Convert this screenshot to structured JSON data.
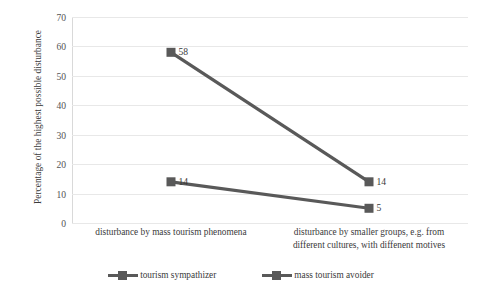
{
  "chart_data": {
    "type": "line",
    "title": "",
    "xlabel": "",
    "ylabel": "Percentage of the highest possible disturbance",
    "categories": [
      "disturbance by mass tourism phenomena",
      "disturbance by smaller groups, e.g. from different cultures, with diffenent motives"
    ],
    "series": [
      {
        "name": "tourism sympathizer",
        "values": [
          58,
          14
        ],
        "color": "#595959",
        "marker": "square",
        "data_labels": [
          "58",
          "14"
        ]
      },
      {
        "name": "mass tourism avoider",
        "values": [
          14,
          5
        ],
        "color": "#595959",
        "marker": "square",
        "data_labels": [
          "14",
          "5"
        ]
      }
    ],
    "ylim": [
      0,
      70
    ],
    "ytick_values": [
      0,
      10,
      20,
      30,
      40,
      50,
      60,
      70
    ],
    "ytick_labels": [
      "0",
      "10",
      "20",
      "30",
      "40",
      "50",
      "60",
      "70"
    ],
    "grid": "horizontal",
    "legend_position": "bottom",
    "gridline_color": "#e8e8e8",
    "text_color": "#3a3a3a",
    "background": "#ffffff"
  },
  "axis": {
    "y_title": "Percentage of the highest possible disturbance"
  },
  "x_labels": [
    "disturbance by mass tourism phenomena",
    "disturbance by smaller groups, e.g. from\ndifferent cultures, with diffenent motives"
  ],
  "x_label_lines": {
    "first": [
      "disturbance by mass tourism phenomena"
    ],
    "second": [
      "disturbance by smaller groups, e.g. from",
      "different cultures, with diffenent motives"
    ]
  },
  "legend": {
    "items": [
      {
        "label": "tourism sympathizer",
        "color": "#595959"
      },
      {
        "label": "mass tourism avoider",
        "color": "#595959"
      }
    ]
  }
}
